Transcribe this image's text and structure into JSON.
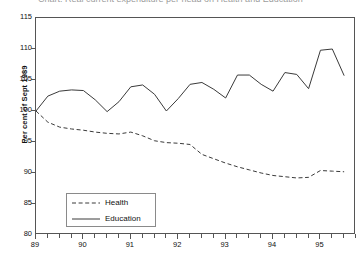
{
  "figure": {
    "clipped_title": "Chart: Real current expenditure per head on Health and Education"
  },
  "chart_data": {
    "type": "line",
    "title": "",
    "xlabel": "",
    "ylabel": "Per cent of Sept 1989",
    "xlim": [
      89.0,
      95.75
    ],
    "ylim": [
      80,
      115
    ],
    "ytick_values": [
      115,
      110,
      105,
      100,
      95,
      90,
      85,
      80
    ],
    "ytick_labels": [
      "115",
      "110",
      "105",
      "100",
      "95",
      "90",
      "85",
      "80"
    ],
    "xtick_values": [
      89,
      90,
      91,
      92,
      93,
      94,
      95
    ],
    "xtick_labels": [
      "89",
      "90",
      "91",
      "92",
      "93",
      "94",
      "95"
    ],
    "minor_xtick_step": 0.25,
    "grid": false,
    "legend_position": "lower-left",
    "x": [
      89.0,
      89.25,
      89.5,
      89.75,
      90.0,
      90.25,
      90.5,
      90.75,
      91.0,
      91.25,
      91.5,
      91.75,
      92.0,
      92.25,
      92.5,
      92.75,
      93.0,
      93.25,
      93.5,
      93.75,
      94.0,
      94.25,
      94.5,
      94.75,
      95.0,
      95.25,
      95.5
    ],
    "series": [
      {
        "name": "Health",
        "style": "dashed",
        "color": "#3a3a3a",
        "values": [
          100.0,
          98.2,
          97.4,
          97.1,
          96.9,
          96.6,
          96.4,
          96.3,
          96.6,
          96.0,
          95.2,
          94.9,
          94.8,
          94.6,
          93.0,
          92.3,
          91.6,
          91.0,
          90.5,
          90.0,
          89.6,
          89.4,
          89.2,
          89.3,
          90.4,
          90.3,
          90.2
        ]
      },
      {
        "name": "Education",
        "style": "solid",
        "color": "#3a3a3a",
        "values": [
          100.0,
          102.4,
          103.2,
          103.4,
          103.3,
          101.8,
          99.9,
          101.5,
          103.9,
          104.2,
          102.7,
          100.0,
          102.0,
          104.3,
          104.6,
          103.5,
          102.1,
          105.8,
          105.8,
          104.3,
          103.2,
          106.2,
          105.9,
          103.6,
          109.8,
          110.0,
          105.7
        ]
      }
    ]
  },
  "legend": {
    "items": [
      {
        "label": "Health",
        "style": "dashed"
      },
      {
        "label": "Education",
        "style": "solid"
      }
    ]
  }
}
